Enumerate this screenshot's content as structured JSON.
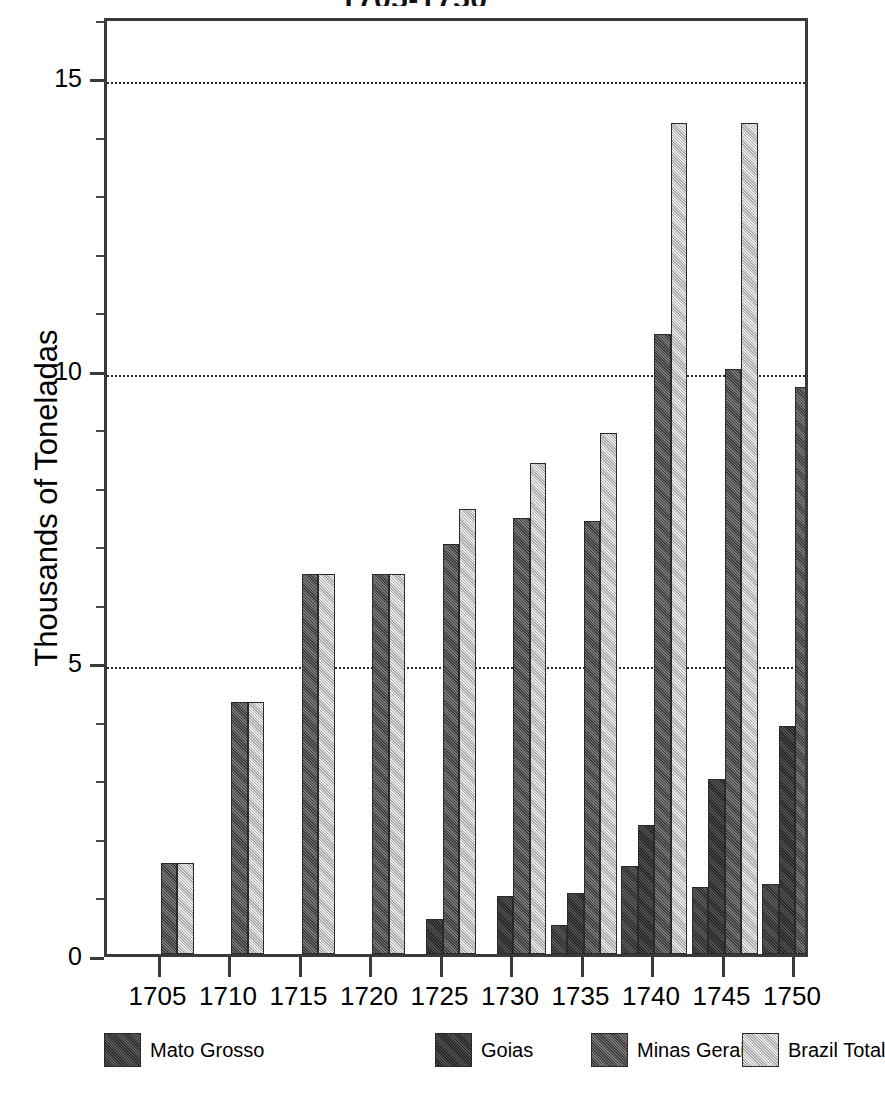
{
  "chart_data": {
    "type": "bar",
    "title": "1705-1750",
    "title_note": "title is clipped at the top edge of the screenshot",
    "xlabel": "",
    "ylabel": "Thousands of Toneladas",
    "categories": [
      "1705",
      "1710",
      "1715",
      "1720",
      "1725",
      "1730",
      "1735",
      "1740",
      "1745",
      "1750"
    ],
    "series": [
      {
        "name": "Mato Grosso",
        "color": "#474747",
        "values": [
          null,
          null,
          null,
          null,
          null,
          null,
          0.5,
          1.5,
          1.15,
          1.2
        ]
      },
      {
        "name": "Goias",
        "color": "#3f3f3f",
        "values": [
          null,
          null,
          null,
          null,
          0.6,
          1.0,
          1.05,
          2.2,
          3.0,
          3.9
        ]
      },
      {
        "name": "Minas Gerais",
        "color": "#565656",
        "values": [
          1.55,
          4.3,
          6.5,
          6.5,
          7.0,
          7.45,
          7.4,
          10.6,
          10.0,
          9.7
        ]
      },
      {
        "name": "Brazil Total",
        "color": "#d8d8d8",
        "values": [
          1.55,
          4.3,
          6.5,
          6.5,
          7.6,
          8.4,
          8.9,
          14.2,
          14.2,
          14.8
        ]
      }
    ],
    "ylim": [
      0,
      16.05
    ],
    "yticks": [
      0,
      5,
      10,
      15
    ],
    "ytick_labels": [
      "0",
      "5",
      "10",
      "15"
    ],
    "yticks_minor": [
      1,
      2,
      3,
      4,
      6,
      7,
      8,
      9,
      11,
      12,
      13,
      14,
      16
    ],
    "grid": true,
    "gridlines_at": [
      5,
      10,
      15
    ],
    "legend_position": "bottom"
  },
  "legend": {
    "items": [
      {
        "label": "Mato Grosso"
      },
      {
        "label": "Goias"
      },
      {
        "label": "Minas Gerais"
      },
      {
        "label": "Brazil Total"
      }
    ]
  }
}
